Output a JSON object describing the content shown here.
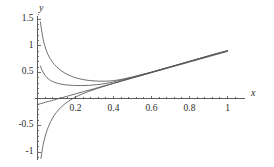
{
  "chart_data": {
    "type": "line",
    "title": "",
    "xlabel": "x",
    "ylabel": "y",
    "xlim": [
      0.0,
      1.05
    ],
    "ylim": [
      -1.15,
      1.6
    ],
    "grid": false,
    "legend": null,
    "axis_style": "cross-axes-at-origin",
    "xticks": [
      0.2,
      0.4,
      0.6,
      0.8,
      1.0
    ],
    "xtick_labels": [
      "0.2",
      "0.4",
      "0.6",
      "0.8",
      "1"
    ],
    "yticks": [
      -1.0,
      -0.5,
      0.5,
      1.0,
      1.5
    ],
    "ytick_labels": [
      "-1",
      "-0.5",
      "0.5",
      "1",
      "1.5"
    ],
    "minor_ticks": true,
    "series": [
      {
        "name": "curve-1-upper-decay",
        "description": "steep decaying curve from y=1.45 converging to common rising line",
        "color": "#555555",
        "x": [
          0.015,
          0.03,
          0.05,
          0.07,
          0.09,
          0.11,
          0.14,
          0.17,
          0.2,
          0.24,
          0.28,
          0.32,
          0.36,
          0.4,
          0.45,
          0.5,
          0.55,
          0.6,
          0.65,
          0.7,
          0.75,
          0.8,
          0.85,
          0.9,
          0.95,
          1.0
        ],
        "y": [
          1.45,
          1.12,
          0.88,
          0.74,
          0.645,
          0.575,
          0.495,
          0.44,
          0.4,
          0.365,
          0.345,
          0.335,
          0.335,
          0.345,
          0.375,
          0.415,
          0.46,
          0.505,
          0.555,
          0.605,
          0.655,
          0.705,
          0.755,
          0.805,
          0.855,
          0.905
        ]
      },
      {
        "name": "curve-2-lower-decay",
        "description": "shallower decaying curve from y=0.62 converging to common rising line",
        "color": "#555555",
        "x": [
          0.015,
          0.03,
          0.05,
          0.07,
          0.09,
          0.12,
          0.15,
          0.19,
          0.23,
          0.27,
          0.31,
          0.35,
          0.4,
          0.45,
          0.5,
          0.55,
          0.6,
          0.65,
          0.7,
          0.75,
          0.8,
          0.85,
          0.9,
          0.95,
          1.0
        ],
        "y": [
          0.62,
          0.5,
          0.4,
          0.345,
          0.312,
          0.282,
          0.265,
          0.255,
          0.252,
          0.256,
          0.268,
          0.286,
          0.32,
          0.362,
          0.408,
          0.456,
          0.506,
          0.556,
          0.607,
          0.658,
          0.709,
          0.76,
          0.811,
          0.862,
          0.91
        ]
      },
      {
        "name": "curve-3-straight-line",
        "description": "near-straight line from y=-0.105 at x=0 rising to y=0.90 at x=1",
        "color": "#555555",
        "x": [
          0.0,
          0.1,
          0.2,
          0.3,
          0.4,
          0.5,
          0.6,
          0.7,
          0.8,
          0.9,
          1.0
        ],
        "y": [
          -0.105,
          -0.005,
          0.095,
          0.195,
          0.295,
          0.395,
          0.495,
          0.595,
          0.695,
          0.795,
          0.895
        ]
      },
      {
        "name": "curve-4-rising-from-below",
        "description": "curve rising steeply from y=-1.12 near x=0, crossing zero near x=0.19",
        "color": "#555555",
        "x": [
          0.018,
          0.03,
          0.045,
          0.06,
          0.08,
          0.1,
          0.13,
          0.16,
          0.19,
          0.23,
          0.27,
          0.31,
          0.35,
          0.4,
          0.45,
          0.5,
          0.55,
          0.6,
          0.65,
          0.7,
          0.75,
          0.8,
          0.85,
          0.9,
          0.95,
          1.0
        ],
        "y": [
          -1.12,
          -0.86,
          -0.65,
          -0.5,
          -0.355,
          -0.25,
          -0.135,
          -0.05,
          0.015,
          0.085,
          0.142,
          0.192,
          0.238,
          0.292,
          0.345,
          0.396,
          0.447,
          0.5,
          0.552,
          0.604,
          0.656,
          0.708,
          0.76,
          0.812,
          0.862,
          0.908
        ]
      }
    ]
  },
  "axes": {
    "x_label": "x",
    "y_label": "y"
  },
  "colors": {
    "curve": "#555555",
    "axis": "#4a4a4a",
    "text": "#2b2b2b",
    "background": "#ffffff"
  }
}
